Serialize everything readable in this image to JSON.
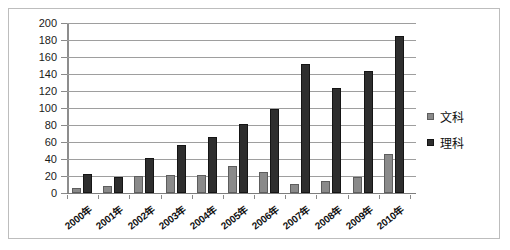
{
  "chart_data": {
    "type": "bar",
    "title": "",
    "xlabel": "",
    "ylabel": "",
    "ylim": [
      0,
      200
    ],
    "ytick_step": 20,
    "yticks": [
      200,
      180,
      160,
      140,
      120,
      100,
      80,
      60,
      40,
      20,
      0
    ],
    "grid": true,
    "legend_position": "right",
    "categories": [
      "2000年",
      "2001年",
      "2002年",
      "2003年",
      "2004年",
      "2005年",
      "2006年",
      "2007年",
      "2008年",
      "2009年",
      "2010年"
    ],
    "series": [
      {
        "name": "文科",
        "color": "#8a8a8a",
        "values": [
          6,
          8,
          20,
          21,
          21,
          32,
          25,
          11,
          14,
          19,
          46
        ]
      },
      {
        "name": "理科",
        "color": "#2e2e2e",
        "values": [
          22,
          19,
          41,
          57,
          66,
          81,
          99,
          152,
          123,
          143,
          185
        ]
      }
    ]
  },
  "legend": {
    "items": [
      {
        "label": "文科",
        "swatch": "wenke"
      },
      {
        "label": "理科",
        "swatch": "like"
      }
    ]
  }
}
